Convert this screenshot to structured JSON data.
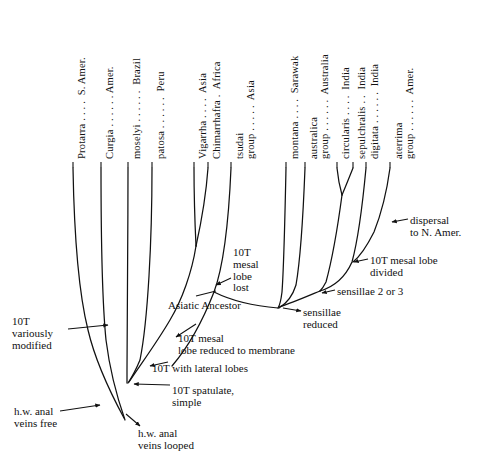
{
  "figure": {
    "kind": "phylogenetic-tree",
    "background": "#ffffff",
    "ink": "#111111"
  },
  "taxa": [
    {
      "name": "protarra",
      "label": "Protarra . . . .  S. Amer.",
      "tip_x": 73,
      "tip_y": 168
    },
    {
      "name": "curgia",
      "label": "Curgia . . . . . . Amer.",
      "tip_x": 101,
      "tip_y": 168
    },
    {
      "name": "moselyi",
      "label": "moselyi . . . . . .  Brazil",
      "tip_x": 128,
      "tip_y": 168
    },
    {
      "name": "patosa",
      "label": "patosa . . . . . .  Peru",
      "tip_x": 152,
      "tip_y": 168
    },
    {
      "name": "vigarrha",
      "label": "Vigarrha . . . .  Asia",
      "tip_x": 194,
      "tip_y": 168
    },
    {
      "name": "chimarrhafra",
      "label": "Chimarrhafra .  Africa",
      "tip_x": 208,
      "tip_y": 168
    },
    {
      "name": "tsudai-group",
      "label": "tsudai\ngroup . . . . .  Asia",
      "tip_x": 231,
      "tip_y": 168
    },
    {
      "name": "montana",
      "label": "montana . . . .  Sarawak",
      "tip_x": 286,
      "tip_y": 168
    },
    {
      "name": "australica-group",
      "label": "australica\ngroup . . . . . .  Australia",
      "tip_x": 305,
      "tip_y": 168
    },
    {
      "name": "circularis",
      "label": "circularis . . . .  India",
      "tip_x": 337,
      "tip_y": 168
    },
    {
      "name": "sepulchralis",
      "label": "sepulchralis . .  India",
      "tip_x": 353,
      "tip_y": 168
    },
    {
      "name": "digitata",
      "label": "digitata . . . . . .  India",
      "tip_x": 366,
      "tip_y": 168
    },
    {
      "name": "aterrima-group",
      "label": "aterrima\ngroup . . . . . .  Amer.",
      "tip_x": 390,
      "tip_y": 168
    }
  ],
  "annotations": [
    {
      "name": "asiatic-ancestor",
      "text": "Asiatic Ancestor",
      "x": 168,
      "y": 300,
      "align": "left"
    },
    {
      "name": "10t-variously-modified",
      "text": "10T\nvariously\nmodified",
      "x": 12,
      "y": 316,
      "align": "left"
    },
    {
      "name": "10t-mesal-lobe-reduced",
      "text": "10T mesal\nlobe reduced to membrane",
      "x": 178,
      "y": 333,
      "align": "left"
    },
    {
      "name": "10t-with-lateral-lobes",
      "text": "10T with lateral lobes",
      "x": 152,
      "y": 363,
      "align": "left"
    },
    {
      "name": "10t-spatulate-simple",
      "text": "10T spatulate,\nsimple",
      "x": 172,
      "y": 385,
      "align": "left"
    },
    {
      "name": "hw-anal-veins-free",
      "text": "h.w. anal\nveins free",
      "x": 14,
      "y": 406,
      "align": "left"
    },
    {
      "name": "hw-anal-veins-looped",
      "text": "h.w. anal\nveins looped",
      "x": 138,
      "y": 428,
      "align": "left"
    },
    {
      "name": "10t-mesal-lobe-lost",
      "text": "10T\nmesal\nlobe\nlost",
      "x": 233,
      "y": 247,
      "align": "left"
    },
    {
      "name": "sensillae-reduced",
      "text": "sensillae\nreduced",
      "x": 303,
      "y": 307,
      "align": "left"
    },
    {
      "name": "sensillae-2-or-3",
      "text": "sensillae 2 or 3",
      "x": 337,
      "y": 286,
      "align": "left"
    },
    {
      "name": "10t-mesal-lobe-divided",
      "text": "10T mesal lobe\ndivided",
      "x": 370,
      "y": 255,
      "align": "left"
    },
    {
      "name": "dispersal-to-n-amer",
      "text": "dispersal\nto N. Amer.",
      "x": 410,
      "y": 215,
      "align": "left"
    }
  ],
  "branches": [
    {
      "name": "branch-protarra",
      "path": "M 73,168 C 74,225 78,290 88,330 C 95,360 110,392 124,418"
    },
    {
      "name": "branch-curgia",
      "path": "M 101,168 C 101,230 102,300 106,340 C 110,372 118,400 125,420"
    },
    {
      "name": "branch-moselyi",
      "path": "M 128,168 C 128,240 127,320 127,370 L 127,383"
    },
    {
      "name": "branch-patosa",
      "path": "M 152,168 C 152,240 148,320 140,360 C 135,372 130,380 128,383"
    },
    {
      "name": "branch-vigarrha",
      "path": "M 194,168 C 194,195 195,225 196,246"
    },
    {
      "name": "branch-chimarrhafra",
      "path": "M 208,168 C 206,196 200,228 196,246"
    },
    {
      "name": "branch-vigarrha-stem",
      "path": "M 196,246 C 192,272 182,300 170,320 C 156,344 138,368 129,382"
    },
    {
      "name": "branch-tsudai",
      "path": "M 231,168 C 229,215 224,265 214,292 C 205,315 190,345 172,366"
    },
    {
      "name": "branch-asiatic-stem",
      "path": "M 214,292 C 230,300 254,306 278,308"
    },
    {
      "name": "branch-montana",
      "path": "M 286,168 C 285,215 284,265 282,292 C 281,300 280,305 278,308"
    },
    {
      "name": "branch-australica",
      "path": "M 305,168 C 303,220 300,262 296,285 C 292,298 284,305 279,308"
    },
    {
      "name": "branch-circularis",
      "path": "M 337,168 C 338,178 340,188 342,195"
    },
    {
      "name": "branch-sepulchralis",
      "path": "M 353,168 C 349,178 345,188 342,195"
    },
    {
      "name": "branch-circ-stem",
      "path": "M 342,195 C 338,225 332,260 326,282 C 323,288 321,290 320,291"
    },
    {
      "name": "branch-digitata",
      "path": "M 366,168 C 363,200 358,240 352,262 C 344,280 330,288 320,291"
    },
    {
      "name": "branch-sensillae23",
      "path": "M 320,291 C 308,296 292,303 279,307"
    },
    {
      "name": "branch-aterrima",
      "path": "M 390,168 C 387,190 382,212 374,232 C 366,248 358,258 353,262"
    }
  ],
  "arrows": [
    {
      "name": "arrow-variously-modified",
      "path": "M 68,329 L 108,325",
      "head": "end"
    },
    {
      "name": "arrow-hw-anal-free",
      "path": "M 60,411 L 100,405",
      "head": "end"
    },
    {
      "name": "arrow-asiatic-ancestor",
      "path": "M 196,296 L 216,291",
      "head": "none"
    },
    {
      "name": "arrow-mesal-reduced",
      "path": "M 176,337 L 196,324",
      "head": "start"
    },
    {
      "name": "arrow-lateral-lobes",
      "path": "M 150,366 L 168,362",
      "head": "start"
    },
    {
      "name": "arrow-spatulate",
      "path": "M 170,385 L 134,384",
      "head": "end"
    },
    {
      "name": "arrow-anal-looped",
      "path": "M 140,426 L 126,414",
      "head": "start"
    },
    {
      "name": "arrow-mesal-lost",
      "path": "M 231,278 L 216,285",
      "head": "end"
    },
    {
      "name": "arrow-sensillae-reduced",
      "path": "M 301,311 L 283,308",
      "head": "start"
    },
    {
      "name": "arrow-sensillae-23",
      "path": "M 335,290 L 322,293",
      "head": "end"
    },
    {
      "name": "arrow-mesal-divided",
      "path": "M 368,259 L 354,262",
      "head": "end"
    },
    {
      "name": "arrow-dispersal",
      "path": "M 408,219 L 392,222",
      "head": "end"
    }
  ]
}
